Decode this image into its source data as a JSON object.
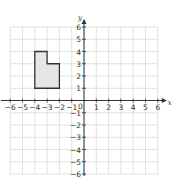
{
  "figure": {
    "type": "coordinate-grid",
    "x_axis": {
      "label": "x",
      "range": [
        -6,
        6
      ],
      "ticks": [
        -6,
        -5,
        -4,
        -3,
        -2,
        -1,
        1,
        2,
        3,
        4,
        5,
        6
      ],
      "tick_labels": [
        "−6",
        "−5",
        "−4",
        "−3",
        "−2",
        "−1",
        "1",
        "2",
        "3",
        "4",
        "5",
        "6"
      ]
    },
    "y_axis": {
      "label": "y",
      "range": [
        -6,
        6
      ],
      "ticks": [
        6,
        5,
        4,
        3,
        2,
        1,
        -1,
        -2,
        -3,
        -4,
        -5,
        -6
      ],
      "tick_labels": [
        "6",
        "5",
        "4",
        "3",
        "2",
        "1",
        "−1",
        "−2",
        "−3",
        "−4",
        "−5",
        "−6"
      ]
    },
    "origin_label": "0",
    "grid": true,
    "shape": {
      "name": "L-shaped polygon",
      "vertices": [
        [
          -4,
          4
        ],
        [
          -3,
          4
        ],
        [
          -3,
          3
        ],
        [
          -2,
          3
        ],
        [
          -2,
          1
        ],
        [
          -4,
          1
        ]
      ],
      "fill": "#e6e6e6",
      "stroke": "#333333"
    }
  }
}
